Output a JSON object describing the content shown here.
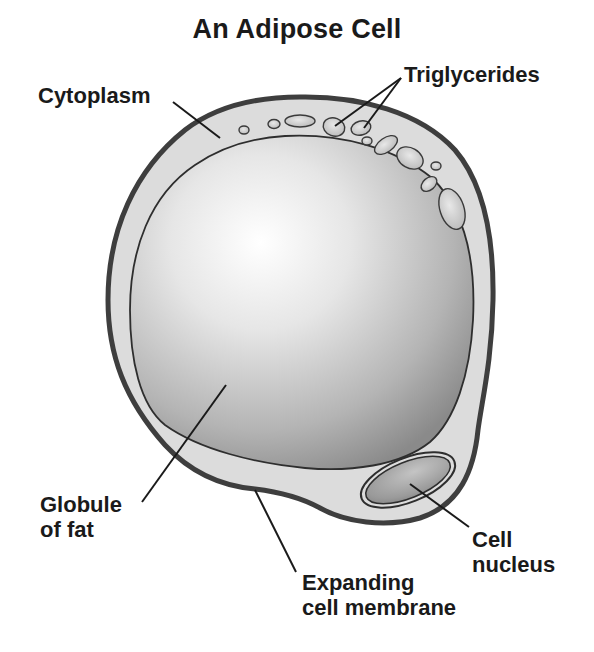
{
  "title": "An Adipose Cell",
  "labels": {
    "cytoplasm": "Cytoplasm",
    "triglycerides": "Triglycerides",
    "globule_line1": "Globule",
    "globule_line2": "of fat",
    "nucleus_line1": "Cell",
    "nucleus_line2": "nucleus",
    "membrane_line1": "Expanding",
    "membrane_line2": "cell membrane"
  },
  "colors": {
    "membrane": "#4a4a4a",
    "cytoplasm": "#dcdcdc",
    "fat_light": "#fbfbfb",
    "fat_dark": "#8e8e8e",
    "nucleus": "#9a9a9a",
    "text": "#1a1a1a"
  }
}
